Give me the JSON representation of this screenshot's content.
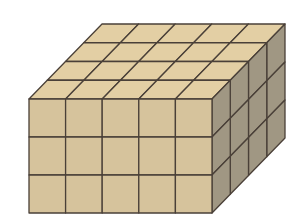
{
  "figure": {
    "dimensions": {
      "length": 5,
      "width": 4,
      "height": 3
    },
    "unit_cube_count": 60,
    "colors": {
      "background": "#ffffff",
      "top_face": "#e3cfa4",
      "front_face": "#d6c39c",
      "right_face": "#a09783",
      "edge": "#4a4038"
    }
  }
}
